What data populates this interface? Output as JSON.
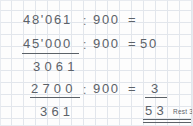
{
  "worksheet": {
    "kind": "long-division-worksheet",
    "language": "de",
    "background": "graph-paper",
    "grid_color": "#e2e6ec",
    "ink_color": "#5c6269",
    "rows": [
      {
        "id": "row1",
        "dividend": "48'061",
        "operator": ":",
        "divisor": "900",
        "equals": "=",
        "quotient": ""
      },
      {
        "id": "row2",
        "dividend": "45'000",
        "operator": ":",
        "divisor": "900",
        "equals": "=",
        "quotient": "50"
      },
      {
        "id": "row3",
        "remainder": "3 0 6 1"
      },
      {
        "id": "row4",
        "dividend": "2700",
        "operator": ":",
        "divisor": "900",
        "equals": "=",
        "quotient": "3"
      },
      {
        "id": "row5",
        "remainder": "3 6 1",
        "total_quotient": "5 3",
        "rest_label": "Rest 361"
      }
    ],
    "text": {
      "r1_dividend": "48'061",
      "r1_colon": ":",
      "r1_divisor": "900",
      "r1_equals": "=",
      "r2_dividend": "45'000",
      "r2_colon": ":",
      "r2_divisor": "900",
      "r2_equals": "=",
      "r2_quotient": "50",
      "r3_remainder": "3061",
      "r4_dividend": "2700",
      "r4_colon": ":",
      "r4_divisor": "900",
      "r4_equals": "=",
      "r4_quotient": "3",
      "r5_remainder": "361",
      "r5_quotient": "53",
      "r5_rest": "Rest 361"
    }
  }
}
